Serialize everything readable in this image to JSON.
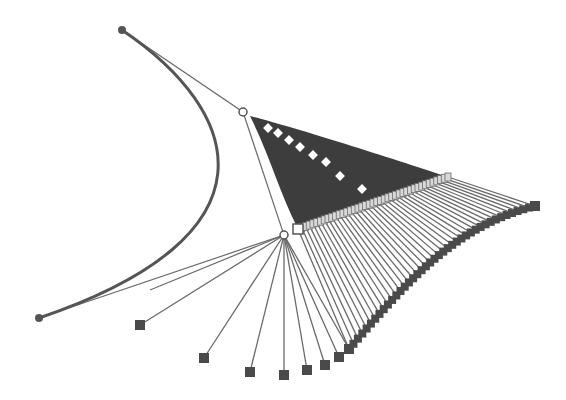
{
  "diagram": {
    "kind": "bezier-construction-sweep",
    "width": 566,
    "height": 400,
    "colors": {
      "background": "#ffffff",
      "curve": "#555555",
      "line": "#6a6a6a",
      "fan_fill": "#3d3d3d",
      "square_fill": "#4a4a4a",
      "open_marker": "#ffffff",
      "marker_stroke": "#555555"
    },
    "control_points": [
      {
        "name": "P0",
        "x": 122,
        "y": 30,
        "marker": "dot"
      },
      {
        "name": "P1",
        "x": 243,
        "y": 112,
        "marker": "open-circle"
      },
      {
        "name": "P2",
        "x": 284,
        "y": 235,
        "marker": "open-circle"
      },
      {
        "name": "P3",
        "x": 39,
        "y": 318,
        "marker": "dot"
      }
    ],
    "sweep": {
      "anchor_open_square": {
        "x": 298,
        "y": 229
      },
      "upper_line_end": {
        "x": 448,
        "y": 177
      },
      "fan_apex": {
        "x": 250,
        "y": 116
      },
      "curve_end_square": {
        "x": 535,
        "y": 206
      },
      "lower_squares": [
        {
          "x": 140,
          "y": 325
        },
        {
          "x": 204,
          "y": 358
        },
        {
          "x": 250,
          "y": 372
        },
        {
          "x": 284,
          "y": 375
        },
        {
          "x": 307,
          "y": 370
        },
        {
          "x": 325,
          "y": 365
        },
        {
          "x": 339,
          "y": 357
        },
        {
          "x": 349,
          "y": 349
        }
      ],
      "diamonds": [
        {
          "x": 268,
          "y": 128
        },
        {
          "x": 278,
          "y": 133
        },
        {
          "x": 289,
          "y": 140
        },
        {
          "x": 300,
          "y": 147
        },
        {
          "x": 313,
          "y": 155
        },
        {
          "x": 326,
          "y": 162
        },
        {
          "x": 340,
          "y": 176
        },
        {
          "x": 362,
          "y": 189
        }
      ],
      "ray_count": 40
    }
  }
}
